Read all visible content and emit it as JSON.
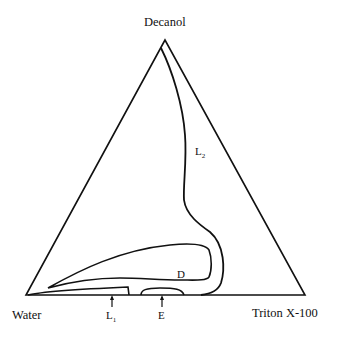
{
  "diagram": {
    "type": "ternary phase diagram",
    "vertices": {
      "top": "Decanol",
      "bottom_left": "Water",
      "bottom_right": "Triton X-100"
    },
    "regions": {
      "L2": {
        "main": "L",
        "sub": "2"
      },
      "D": {
        "main": "D"
      },
      "L1": {
        "main": "L",
        "sub": "1"
      },
      "E": {
        "main": "E"
      }
    },
    "colors": {
      "line": "#111111",
      "background": "#ffffff"
    }
  }
}
